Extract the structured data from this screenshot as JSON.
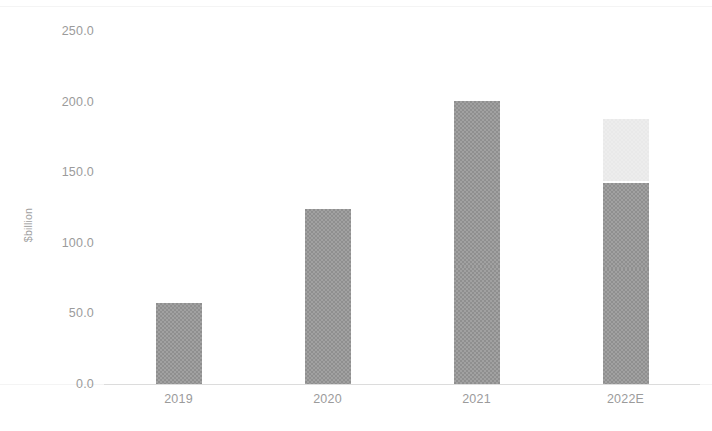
{
  "chart_data": {
    "type": "bar",
    "stacked": true,
    "title": "",
    "xlabel": "",
    "ylabel": "$billion",
    "categories": [
      "2019",
      "2020",
      "2021",
      "2022E"
    ],
    "ylim": [
      0,
      250
    ],
    "yticks": [
      0.0,
      50.0,
      100.0,
      150.0,
      200.0,
      250.0
    ],
    "ytick_labels": [
      "0.0",
      "50.0",
      "100.0",
      "150.0",
      "200.0",
      "250.0"
    ],
    "grid": false,
    "legend": "none",
    "series": [
      {
        "name": "segment-1",
        "color": "#8f8f8f",
        "values": [
          56,
          80,
          82,
          80
        ]
      },
      {
        "name": "segment-2",
        "color": "#8f8f8f",
        "values": [
          0,
          43,
          116,
          61
        ]
      },
      {
        "name": "segment-3",
        "color": "#e9e9e9",
        "values": [
          0,
          0,
          0,
          43
        ]
      }
    ],
    "totals": [
      56,
      123,
      198,
      184
    ],
    "bars": [
      {
        "category": "2019",
        "total": 56,
        "segments": [
          {
            "value": 56,
            "color": "#8f8f8f",
            "divider_above": false
          }
        ]
      },
      {
        "category": "2020",
        "total": 123,
        "segments": [
          {
            "value": 80,
            "color": "#8f8f8f",
            "divider_above": false
          },
          {
            "value": 43,
            "color": "#8f8f8f",
            "divider_above": true
          }
        ]
      },
      {
        "category": "2021",
        "total": 198,
        "segments": [
          {
            "value": 82,
            "color": "#8f8f8f",
            "divider_above": false
          },
          {
            "value": 116,
            "color": "#8f8f8f",
            "divider_above": true
          }
        ]
      },
      {
        "category": "2022E",
        "total": 184,
        "segments": [
          {
            "value": 80,
            "color": "#8f8f8f",
            "divider_above": false
          },
          {
            "value": 61,
            "color": "#8f8f8f",
            "divider_above": true
          },
          {
            "value": 43,
            "color": "#e9e9e9",
            "divider_above": false
          }
        ]
      }
    ]
  },
  "axes": {
    "y_label": "$billion",
    "y_ticks": [
      "250.0",
      "200.0",
      "150.0",
      "100.0",
      "50.0",
      "0.0"
    ],
    "x_ticks": [
      "2019",
      "2020",
      "2021",
      "2022E"
    ]
  },
  "colors": {
    "bar_dark": "#8f8f8f",
    "bar_light": "#e9e9e9",
    "axis_line": "#dcdcdc",
    "tick_text": "#9b9b9b"
  }
}
